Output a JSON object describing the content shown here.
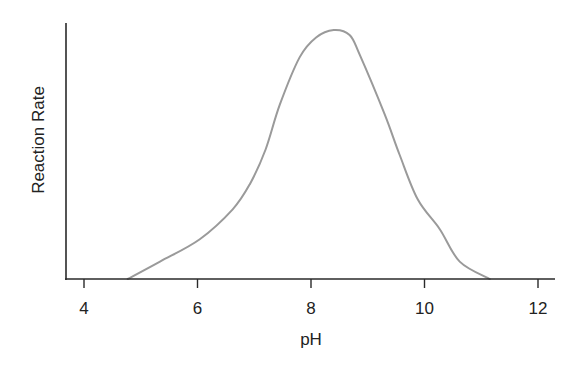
{
  "chart_data": {
    "type": "line",
    "title": "",
    "xlabel": "pH",
    "ylabel": "Reaction Rate",
    "xlim": [
      3.7,
      12.3
    ],
    "ylim": [
      0,
      1.03
    ],
    "x_ticks": [
      4,
      6,
      8,
      10,
      12
    ],
    "x_tick_labels": [
      "4",
      "6",
      "8",
      "10",
      "12"
    ],
    "y_ticks": [],
    "grid": false,
    "legend": null,
    "series": [
      {
        "name": "Reaction Rate vs pH",
        "color": "#9a9a9a",
        "x": [
          4.77,
          5.34,
          6.04,
          6.62,
          6.92,
          7.2,
          7.45,
          7.8,
          8.09,
          8.4,
          8.68,
          8.86,
          9.3,
          9.56,
          9.88,
          10.27,
          10.62,
          11.15
        ],
        "y": [
          0.0,
          0.07,
          0.16,
          0.28,
          0.38,
          0.52,
          0.7,
          0.89,
          0.97,
          1.0,
          0.98,
          0.9,
          0.66,
          0.5,
          0.32,
          0.2,
          0.07,
          0.0
        ]
      }
    ],
    "annotations": []
  },
  "colors": {
    "axis": "#2a2a2a",
    "curve": "#9a9a9a",
    "text": "#222222",
    "background": "#ffffff"
  }
}
